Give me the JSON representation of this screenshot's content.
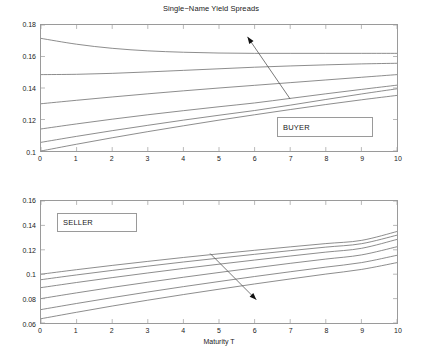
{
  "figure": {
    "title": "Single−Name Yield Spreads",
    "background": "#ffffff",
    "line_color": "#6e6e6e",
    "axis_color": "#9a9a9a",
    "text_color": "#1a1a1a"
  },
  "chart_data": [
    {
      "type": "line",
      "title": "Single−Name Yield Spreads",
      "panel": "top",
      "annotation": "BUYER",
      "xlabel": "",
      "ylabel": "",
      "xlim": [
        0,
        10
      ],
      "ylim": [
        0.1,
        0.18
      ],
      "grid": false,
      "legend": "none",
      "xticks": [
        0,
        1,
        2,
        3,
        4,
        5,
        6,
        7,
        8,
        9,
        10
      ],
      "xticklabels": [
        "0",
        "1",
        "2",
        "3",
        "4",
        "5",
        "6",
        "7",
        "8",
        "9",
        "10"
      ],
      "yticks": [
        0.1,
        0.12,
        0.14,
        0.16,
        0.18
      ],
      "yticklabels": [
        "0.1",
        "0.12",
        "0.14",
        "0.16",
        "0.18"
      ],
      "x": [
        0,
        1,
        2,
        3,
        4,
        5,
        6,
        7,
        8,
        9,
        10
      ],
      "series": [
        {
          "name": "curve-1",
          "values": [
            0.1715,
            0.1678,
            0.1652,
            0.1636,
            0.1627,
            0.1622,
            0.162,
            0.162,
            0.162,
            0.162,
            0.162
          ]
        },
        {
          "name": "curve-2",
          "values": [
            0.1485,
            0.1487,
            0.1493,
            0.1502,
            0.1512,
            0.1522,
            0.1532,
            0.154,
            0.1547,
            0.1553,
            0.1557
          ]
        },
        {
          "name": "curve-3",
          "values": [
            0.13,
            0.1322,
            0.1343,
            0.1363,
            0.1382,
            0.14,
            0.1417,
            0.1434,
            0.1451,
            0.1468,
            0.1485
          ]
        },
        {
          "name": "curve-4",
          "values": [
            0.114,
            0.1172,
            0.1202,
            0.123,
            0.1256,
            0.1281,
            0.1305,
            0.1334,
            0.1363,
            0.1391,
            0.1418
          ]
        },
        {
          "name": "curve-5",
          "values": [
            0.1055,
            0.1093,
            0.1129,
            0.1163,
            0.1196,
            0.1227,
            0.1257,
            0.1291,
            0.1327,
            0.1362,
            0.1395
          ]
        },
        {
          "name": "curve-6",
          "values": [
            0.1,
            0.1043,
            0.1084,
            0.1123,
            0.116,
            0.1196,
            0.123,
            0.1263,
            0.1295,
            0.1325,
            0.1353
          ]
        }
      ],
      "arrow": {
        "name": "direction-arrow",
        "from_x": 7.0,
        "from_y": 0.133,
        "to_x": 5.8,
        "to_y": 0.1725,
        "direction": "up-left"
      }
    },
    {
      "type": "line",
      "title": "",
      "panel": "bottom",
      "annotation": "SELLER",
      "xlabel": "Maturity T",
      "ylabel": "",
      "xlim": [
        0,
        10
      ],
      "ylim": [
        0.06,
        0.16
      ],
      "grid": false,
      "legend": "none",
      "xticks": [
        0,
        1,
        2,
        3,
        4,
        5,
        6,
        7,
        8,
        9,
        10
      ],
      "xticklabels": [
        "0",
        "1",
        "2",
        "3",
        "4",
        "5",
        "6",
        "7",
        "8",
        "9",
        "10"
      ],
      "yticks": [
        0.06,
        0.08,
        0.1,
        0.12,
        0.14,
        0.16
      ],
      "yticklabels": [
        "0.06",
        "0.08",
        "0.1",
        "0.12",
        "0.14",
        "0.16"
      ],
      "x": [
        0,
        1,
        2,
        3,
        4,
        5,
        6,
        7,
        8,
        9,
        10
      ],
      "series": [
        {
          "name": "curve-1",
          "values": [
            0.1,
            0.1037,
            0.1072,
            0.1105,
            0.1137,
            0.1167,
            0.1196,
            0.1224,
            0.1251,
            0.1277,
            0.135
          ]
        },
        {
          "name": "curve-2",
          "values": [
            0.0955,
            0.0994,
            0.1031,
            0.1066,
            0.11,
            0.1132,
            0.1163,
            0.1193,
            0.1222,
            0.125,
            0.132
          ]
        },
        {
          "name": "curve-3",
          "values": [
            0.089,
            0.0932,
            0.0972,
            0.101,
            0.1047,
            0.1082,
            0.1116,
            0.1149,
            0.1181,
            0.1212,
            0.1285
          ]
        },
        {
          "name": "curve-4",
          "values": [
            0.08,
            0.0847,
            0.0892,
            0.0934,
            0.0975,
            0.1014,
            0.1052,
            0.1089,
            0.1124,
            0.1158,
            0.1225
          ]
        },
        {
          "name": "curve-5",
          "values": [
            0.071,
            0.076,
            0.0808,
            0.0854,
            0.0898,
            0.094,
            0.0981,
            0.102,
            0.1058,
            0.1095,
            0.1155
          ]
        },
        {
          "name": "curve-6",
          "values": [
            0.0635,
            0.0688,
            0.0739,
            0.0787,
            0.0833,
            0.0877,
            0.092,
            0.0961,
            0.1001,
            0.1039,
            0.1095
          ]
        }
      ],
      "arrow": {
        "name": "direction-arrow",
        "from_x": 4.75,
        "from_y": 0.117,
        "to_x": 6.05,
        "to_y": 0.079,
        "direction": "down-right"
      }
    }
  ]
}
